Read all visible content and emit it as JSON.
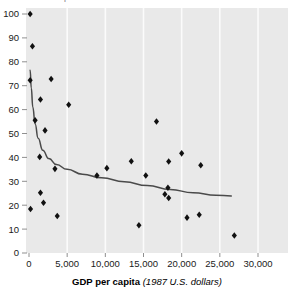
{
  "axis_label_top_clipped": "p",
  "xaxis": {
    "label_bold": "GDP per capita",
    "label_italic": "(1987 U.S. dollars)",
    "ticks": [
      "0",
      "5,000",
      "10,000",
      "15,000",
      "20,000",
      "25,000",
      "30,000"
    ]
  },
  "yaxis": {
    "ticks": [
      "0",
      "10",
      "20",
      "30",
      "40",
      "50",
      "60",
      "70",
      "80",
      "90",
      "100"
    ]
  },
  "colors": {
    "plot_background": "#e9e9e9",
    "gridline": "#fbfbfb",
    "marker": "#111111",
    "trend_line": "#4a4a4a",
    "tick_text": "#1a1a1a",
    "page_background": "#ffffff"
  },
  "chart_data": {
    "type": "scatter",
    "title": "",
    "xlabel": "GDP per capita (1987 U.S. dollars)",
    "ylabel": "",
    "xlim": [
      0,
      30000
    ],
    "ylim": [
      0,
      100
    ],
    "xticks": [
      0,
      5000,
      10000,
      15000,
      20000,
      25000,
      30000
    ],
    "yticks": [
      0,
      10,
      20,
      30,
      40,
      50,
      60,
      70,
      80,
      90,
      100
    ],
    "grid": "vertical-major-light",
    "legend": "none",
    "marker_style": "filled-diamond",
    "points": [
      {
        "x": 150,
        "y": 100.0
      },
      {
        "x": 450,
        "y": 86.5
      },
      {
        "x": 150,
        "y": 72.3
      },
      {
        "x": 2900,
        "y": 72.8
      },
      {
        "x": 1500,
        "y": 64.2
      },
      {
        "x": 5200,
        "y": 62.0
      },
      {
        "x": 800,
        "y": 55.5
      },
      {
        "x": 2100,
        "y": 51.3
      },
      {
        "x": 16700,
        "y": 55.0
      },
      {
        "x": 1400,
        "y": 40.2
      },
      {
        "x": 20000,
        "y": 41.7
      },
      {
        "x": 13400,
        "y": 38.4
      },
      {
        "x": 18300,
        "y": 38.3
      },
      {
        "x": 22500,
        "y": 36.7
      },
      {
        "x": 10200,
        "y": 35.5
      },
      {
        "x": 3400,
        "y": 35.2
      },
      {
        "x": 8900,
        "y": 32.4
      },
      {
        "x": 15300,
        "y": 32.4
      },
      {
        "x": 18200,
        "y": 27.3
      },
      {
        "x": 17800,
        "y": 24.6
      },
      {
        "x": 18300,
        "y": 23.0
      },
      {
        "x": 1500,
        "y": 25.2
      },
      {
        "x": 1900,
        "y": 21.0
      },
      {
        "x": 200,
        "y": 18.4
      },
      {
        "x": 22300,
        "y": 16.0
      },
      {
        "x": 20700,
        "y": 14.8
      },
      {
        "x": 3700,
        "y": 15.5
      },
      {
        "x": 14400,
        "y": 11.6
      },
      {
        "x": 26900,
        "y": 7.3
      }
    ],
    "trend_line": {
      "style": "solid",
      "description": "decaying power-law fit curve through the scatter",
      "points": [
        {
          "x": 150,
          "y": 76.5
        },
        {
          "x": 300,
          "y": 69.0
        },
        {
          "x": 500,
          "y": 61.0
        },
        {
          "x": 800,
          "y": 54.0
        },
        {
          "x": 1200,
          "y": 48.0
        },
        {
          "x": 1800,
          "y": 43.0
        },
        {
          "x": 2600,
          "y": 39.5
        },
        {
          "x": 3600,
          "y": 37.0
        },
        {
          "x": 5000,
          "y": 35.0
        },
        {
          "x": 7000,
          "y": 33.0
        },
        {
          "x": 9500,
          "y": 31.5
        },
        {
          "x": 12500,
          "y": 29.8
        },
        {
          "x": 15500,
          "y": 28.2
        },
        {
          "x": 18500,
          "y": 26.6
        },
        {
          "x": 21500,
          "y": 25.2
        },
        {
          "x": 24500,
          "y": 24.2
        },
        {
          "x": 26500,
          "y": 23.9
        }
      ]
    }
  }
}
